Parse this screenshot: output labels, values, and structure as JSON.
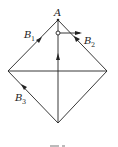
{
  "diagram": {
    "type": "geometry-force-diagram",
    "labels": {
      "apex": "A",
      "b1_main": "B",
      "b1_sub": "1",
      "b2_main": "B",
      "b2_sub": "2",
      "b3_main": "B",
      "b3_sub": "3"
    },
    "colors": {
      "stroke": "#222222",
      "background": "#ffffff"
    },
    "vertices": {
      "top": [
        58,
        20
      ],
      "left": [
        8,
        71
      ],
      "right": [
        107,
        71
      ],
      "bottom": [
        58,
        123
      ]
    }
  }
}
